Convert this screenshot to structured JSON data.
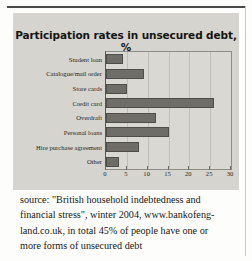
{
  "figure": {
    "title": "Participation rates in unsecured debt, %",
    "source_lines": [
      "source: \"British household indebtedness and",
      "financial stress\", winter 2004, www.bankofeng-",
      "land.co.uk, in total 45% of people have one or",
      "more forms of unsecured debt"
    ]
  },
  "chart_data": {
    "type": "bar",
    "orientation": "horizontal",
    "title": "Participation rates in unsecured debt, %",
    "xlabel": "",
    "ylabel": "",
    "xlim": [
      0,
      30
    ],
    "xticks": [
      "0",
      "5",
      "10",
      "15",
      "20",
      "25",
      "30"
    ],
    "grid": true,
    "legend": "none",
    "bar_color": "#6e6d67",
    "categories": [
      "Student loan",
      "Catalogue/mail order",
      "Store cards",
      "Credit card",
      "Overdraft",
      "Personal loans",
      "Hire purchase agreement",
      "Other"
    ],
    "values": [
      4,
      9,
      5,
      26,
      12,
      15,
      8,
      3
    ]
  }
}
